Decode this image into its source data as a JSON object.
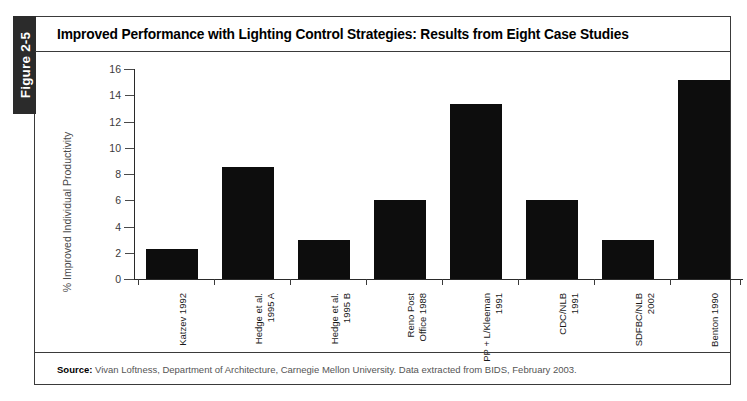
{
  "figure": {
    "tab_label": "Figure 2-5",
    "title": "Improved Performance with Lighting Control Strategies: Results from Eight Case Studies",
    "source_prefix": "Source:",
    "source_text": "Vivan Loftness, Department of Architecture, Carnegie Mellon University. Data extracted from BIDS,  February 2003."
  },
  "chart_data": {
    "type": "bar",
    "title": "Improved Performance with Lighting Control Strategies: Results from Eight Case Studies",
    "xlabel": "",
    "ylabel": "% Improved Individual Productivity",
    "ylim": [
      0,
      16
    ],
    "yticks": [
      0,
      2,
      4,
      6,
      8,
      10,
      12,
      14,
      16
    ],
    "ytick_labels": [
      "0",
      "2",
      "4",
      "6",
      "8",
      "10",
      "12",
      "14",
      "16"
    ],
    "grid": false,
    "legend": null,
    "bar_color": "#0d0d0d",
    "categories": [
      "Katzev 1992",
      "Hedge et al. 1995 A",
      "Hedge et al. 1995 B",
      "Reno Post Office 1988",
      "PP + L/Kleeman 1991",
      "CDC/NLB 1991",
      "SDFBC/NLB 2002",
      "Benton 1990"
    ],
    "category_lines": [
      [
        "Katzev 1992"
      ],
      [
        "Hedge et al.",
        "1995 A"
      ],
      [
        "Hedge et al.",
        "1995 B"
      ],
      [
        "Reno Post",
        "Office 1988"
      ],
      [
        "PP + L/Kleeman",
        "1991"
      ],
      [
        "CDC/NLB",
        "1991"
      ],
      [
        "SDFBC/NLB",
        "2002"
      ],
      [
        "Benton 1990"
      ]
    ],
    "values": [
      2.3,
      8.5,
      3.0,
      6.0,
      13.3,
      6.0,
      3.0,
      15.2
    ]
  }
}
